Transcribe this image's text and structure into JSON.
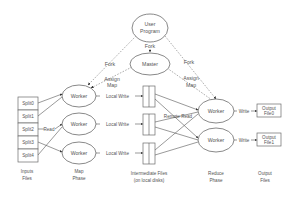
{
  "diagram": {
    "nodes": {
      "user_program": {
        "line1": "User",
        "line2": "Program"
      },
      "master": "Master",
      "map_workers": [
        "Worker",
        "Worker",
        "Worker"
      ],
      "reduce_workers": [
        "Worker",
        "Worker"
      ],
      "splits": [
        "Split0",
        "Split1",
        "Split2",
        "Split3",
        "Split4"
      ],
      "output_files": [
        {
          "line1": "Output",
          "line2": "File0"
        },
        {
          "line1": "Output",
          "line2": "File1"
        }
      ]
    },
    "edge_labels": {
      "fork_master": "Fork",
      "fork_left": "Fork",
      "fork_right": "Fork",
      "assign_map": {
        "line1": "Assign",
        "line2": "Map"
      },
      "assign_reduce": {
        "line1": "Assign",
        "line2": "Map"
      },
      "read": "Read",
      "local_write": [
        "Local Write",
        "Local Write",
        "Local Write"
      ],
      "remote_read": "Remote Read",
      "write": [
        "Write",
        "Write"
      ]
    },
    "phase_labels": {
      "input": {
        "line1": "Inputs",
        "line2": "Files"
      },
      "map": {
        "line1": "Map",
        "line2": "Phase"
      },
      "intermediate": {
        "line1": "Intermediate Files",
        "line2": "(on local disks)"
      },
      "reduce": {
        "line1": "Reduce",
        "line2": "Phase"
      },
      "output": {
        "line1": "Output",
        "line2": "Files"
      }
    }
  }
}
